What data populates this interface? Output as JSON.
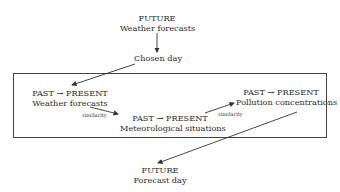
{
  "nodes": {
    "future_forecasts": {
      "line1": "FUTURE",
      "line2": "Weather forecasts"
    },
    "chosen_day": {
      "label": "Chosen day"
    },
    "past_forecasts": {
      "line1": "PAST → PRESENT",
      "line2": "Weather forecasts"
    },
    "past_meteo": {
      "line1": "PAST → PRESENT",
      "line2": "Meteorological situations"
    },
    "past_pollution": {
      "line1": "PAST → PRESENT",
      "line2": "Pollution concentrations"
    },
    "forecast_day": {
      "line1": "FUTURE",
      "line2": "Forecast day"
    }
  },
  "edges": {
    "similarity_1": "similarity",
    "similarity_2": "similarity"
  },
  "colors": {
    "line": "#333333",
    "text": "#2a2a2a"
  }
}
